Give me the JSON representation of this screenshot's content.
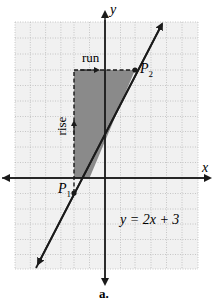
{
  "diagram": {
    "axes": {
      "x_label": "x",
      "y_label": "y"
    },
    "line": {
      "equation": "y = 2x + 3",
      "slope": 2,
      "intercept": 3
    },
    "points": [
      {
        "name": "P",
        "sub": "1",
        "x": -2,
        "y": -1
      },
      {
        "name": "P",
        "sub": "2",
        "x": 1,
        "y": 5
      }
    ],
    "labels": {
      "run": "run",
      "rise": "rise"
    },
    "caption": "a.",
    "grid": {
      "x_range": [
        -6,
        6
      ],
      "y_range": [
        -6,
        10
      ]
    },
    "colors": {
      "grid": "#bbbbbb",
      "shade": "#8a8a8a",
      "line": "#1a1a1a",
      "background": "#f1f1f1"
    }
  }
}
